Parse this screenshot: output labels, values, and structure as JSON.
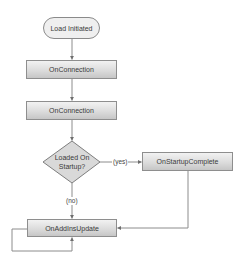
{
  "diagram": {
    "type": "flowchart",
    "colors": {
      "line": "#8c8c8c",
      "node_border": "#8e8e8e",
      "terminal_fill": "#efefef",
      "process_fill_top": "#f2f2f2",
      "process_fill_bottom": "#c6c6c6",
      "decision_fill": "#d9d9d9",
      "text": "#3a3a3a"
    },
    "nodes": {
      "start": {
        "label": "Load Initiated",
        "shape": "terminal"
      },
      "on_connection_1": {
        "label": "OnConnection",
        "shape": "process"
      },
      "on_connection_2": {
        "label": "OnConnection",
        "shape": "process"
      },
      "decision": {
        "label": "Loaded On\nStartup?",
        "shape": "decision"
      },
      "on_startup_complete": {
        "label": "OnStartupComplete",
        "shape": "process"
      },
      "on_addins_update": {
        "label": "OnAddInsUpdate",
        "shape": "process"
      }
    },
    "edges": [
      {
        "from": "start",
        "to": "on_connection_1",
        "label": ""
      },
      {
        "from": "on_connection_1",
        "to": "on_connection_2",
        "label": ""
      },
      {
        "from": "on_connection_2",
        "to": "decision",
        "label": ""
      },
      {
        "from": "decision",
        "to": "on_startup_complete",
        "label": "(yes)"
      },
      {
        "from": "decision",
        "to": "on_addins_update",
        "label": "(no)"
      },
      {
        "from": "on_startup_complete",
        "to": "on_addins_update",
        "label": ""
      },
      {
        "from": "on_addins_update",
        "to": "on_addins_update",
        "label": ""
      }
    ],
    "edge_labels": {
      "yes": "(yes)",
      "no": "(no)"
    }
  }
}
